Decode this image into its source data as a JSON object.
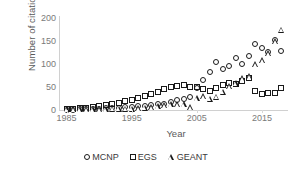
{
  "chart_data": {
    "type": "scatter",
    "title": "",
    "xlabel": "Year",
    "ylabel": "Number of citations",
    "xlim": [
      1984,
      2019
    ],
    "ylim": [
      0,
      200
    ],
    "xticks": [
      1985,
      1995,
      2005,
      2015
    ],
    "yticks": [
      0,
      50,
      100,
      150,
      200
    ],
    "grid": false,
    "legend_position": "bottom",
    "series": [
      {
        "name": "MCNP",
        "marker": "circle",
        "x": [
          1985,
          1986,
          1987,
          1988,
          1989,
          1990,
          1991,
          1992,
          1993,
          1994,
          1995,
          1996,
          1997,
          1998,
          1999,
          2000,
          2001,
          2002,
          2003,
          2004,
          2005,
          2006,
          2007,
          2008,
          2009,
          2010,
          2011,
          2012,
          2013,
          2014,
          2015,
          2016,
          2017,
          2018
        ],
        "y": [
          1,
          1,
          2,
          2,
          3,
          3,
          4,
          5,
          5,
          6,
          7,
          8,
          9,
          10,
          12,
          14,
          18,
          22,
          24,
          28,
          48,
          66,
          83,
          105,
          89,
          96,
          112,
          100,
          118,
          143,
          134,
          126,
          152,
          128
        ]
      },
      {
        "name": "EGS",
        "marker": "square",
        "x": [
          1985,
          1986,
          1987,
          1988,
          1989,
          1990,
          1991,
          1992,
          1993,
          1994,
          1995,
          1996,
          1997,
          1998,
          1999,
          2000,
          2001,
          2002,
          2003,
          2004,
          2005,
          2006,
          2007,
          2008,
          2009,
          2010,
          2011,
          2012,
          2013,
          2014,
          2015,
          2016,
          2017,
          2018
        ],
        "y": [
          2,
          3,
          4,
          5,
          7,
          9,
          11,
          13,
          16,
          19,
          22,
          26,
          30,
          34,
          39,
          45,
          50,
          52,
          54,
          49,
          50,
          46,
          41,
          47,
          55,
          58,
          57,
          62,
          70,
          41,
          35,
          36,
          38,
          47
        ]
      },
      {
        "name": "GEANT",
        "marker": "triangle",
        "x": [
          1985,
          1986,
          1987,
          1988,
          1989,
          1990,
          1991,
          1992,
          1993,
          1994,
          1995,
          1996,
          1997,
          1998,
          1999,
          2000,
          2001,
          2002,
          2003,
          2004,
          2005,
          2006,
          2007,
          2008,
          2009,
          2010,
          2011,
          2012,
          2013,
          2014,
          2015,
          2016,
          2017,
          2018
        ],
        "y": [
          2,
          2,
          2,
          2,
          2,
          2,
          2,
          3,
          3,
          3,
          3,
          4,
          5,
          6,
          8,
          10,
          12,
          13,
          13,
          6,
          26,
          30,
          25,
          29,
          40,
          52,
          58,
          69,
          74,
          100,
          108,
          123,
          150,
          175
        ]
      }
    ]
  },
  "legend": {
    "items": [
      {
        "label": "MCNP",
        "marker": "circle"
      },
      {
        "label": "EGS",
        "marker": "square"
      },
      {
        "label": "GEANT",
        "marker": "triangle"
      }
    ]
  },
  "colors": {
    "marker_stroke": "#1a1a1a",
    "axis": "#d0d0d0",
    "tick_text": "#7a7a7a",
    "axis_title": "#5a5a5a",
    "background": "#ffffff"
  }
}
